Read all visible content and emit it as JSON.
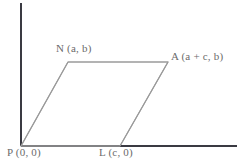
{
  "figure": {
    "type": "geometry-diagram",
    "shape_name": "parallelogram",
    "canvas": {
      "width": 241,
      "height": 163,
      "background": "#ffffff"
    },
    "colors": {
      "axis": "#3a3a42",
      "shape_stroke": "#9a9a9a",
      "label_text": "#6b6b6b"
    },
    "axes": {
      "y_axis": {
        "name": "y-axis",
        "x": 21,
        "y_top": 3,
        "y_bottom": 146
      },
      "x_axis": {
        "name": "x-axis",
        "y": 146,
        "x_left": 21,
        "x_right": 237
      }
    },
    "vertices": [
      {
        "id": "P",
        "letter": "P",
        "coords": "(0, 0)",
        "label": "P (0, 0)",
        "px": 21,
        "py": 146
      },
      {
        "id": "L",
        "letter": "L",
        "coords": "(c, 0)",
        "label": "L (c, 0)",
        "px": 120,
        "py": 146
      },
      {
        "id": "A",
        "letter": "A",
        "coords": "(a + c, b)",
        "label": "A (a + c, b)",
        "px": 168,
        "py": 62
      },
      {
        "id": "N",
        "letter": "N",
        "coords": "(a, b)",
        "label": "N (a, b)",
        "px": 68,
        "py": 62
      }
    ],
    "edges": [
      {
        "id": "PL",
        "from": "P",
        "to": "L"
      },
      {
        "id": "LA",
        "from": "L",
        "to": "A"
      },
      {
        "id": "AN",
        "from": "A",
        "to": "N"
      },
      {
        "id": "NP",
        "from": "N",
        "to": "P"
      }
    ],
    "labels": {
      "N": "N (a, b)",
      "A": "A (a + c, b)",
      "P": "P (0, 0)",
      "L": "L (c, 0)"
    }
  }
}
